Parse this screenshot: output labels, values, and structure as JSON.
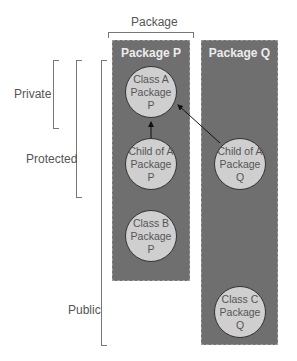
{
  "diagram": {
    "top_label": "Package",
    "packages": [
      {
        "id": "P",
        "title": "Package P"
      },
      {
        "id": "Q",
        "title": "Package Q"
      }
    ],
    "classes": [
      {
        "id": "classA_P",
        "line1": "Class A",
        "line2": "Package P"
      },
      {
        "id": "childA_P",
        "line1": "Child of A",
        "line2": "Package P"
      },
      {
        "id": "classB_P",
        "line1": "Class B",
        "line2": "Package P"
      },
      {
        "id": "childA_Q",
        "line1": "Child of A",
        "line2": "Package Q"
      },
      {
        "id": "classC_Q",
        "line1": "Class C",
        "line2": "Package Q"
      }
    ],
    "access_levels": [
      {
        "label": "Private"
      },
      {
        "label": "Protected"
      },
      {
        "label": "Public"
      }
    ],
    "arrows": [
      {
        "from": "Child of A / Package P",
        "to": "Class A / Package P"
      },
      {
        "from": "Child of A / Package Q",
        "to": "Class A / Package P"
      }
    ],
    "colors": {
      "package_fill": "#6f6f6f",
      "class_fill": "#cfcfcf",
      "text": "#555555"
    }
  }
}
